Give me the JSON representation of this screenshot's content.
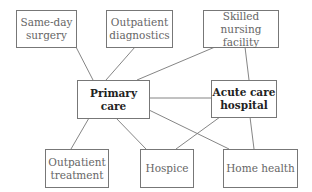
{
  "diagram": {
    "nodes": [
      {
        "id": "same_day_surgery",
        "label": "Same-day surgery",
        "bold": false
      },
      {
        "id": "outpatient_diagnostics",
        "label": "Outpatient diagnostics",
        "bold": false
      },
      {
        "id": "skilled_nursing_facility",
        "label": "Skilled nursing facility",
        "bold": false
      },
      {
        "id": "primary_care",
        "label": "Primary care",
        "bold": true
      },
      {
        "id": "acute_care_hospital",
        "label": "Acute care hospital",
        "bold": true
      },
      {
        "id": "outpatient_treatment",
        "label": "Outpatient treatment",
        "bold": false
      },
      {
        "id": "hospice",
        "label": "Hospice",
        "bold": false
      },
      {
        "id": "home_health",
        "label": "Home health",
        "bold": false
      }
    ],
    "edges": [
      [
        "same_day_surgery",
        "primary_care"
      ],
      [
        "outpatient_diagnostics",
        "primary_care"
      ],
      [
        "skilled_nursing_facility",
        "primary_care"
      ],
      [
        "skilled_nursing_facility",
        "acute_care_hospital"
      ],
      [
        "primary_care",
        "acute_care_hospital"
      ],
      [
        "primary_care",
        "outpatient_treatment"
      ],
      [
        "primary_care",
        "hospice"
      ],
      [
        "primary_care",
        "home_health"
      ],
      [
        "acute_care_hospital",
        "hospice"
      ],
      [
        "acute_care_hospital",
        "home_health"
      ]
    ],
    "labels": {
      "same_day_surgery_l1": "Same-day",
      "same_day_surgery_l2": "surgery",
      "outpatient_diagnostics_l1": "Outpatient",
      "outpatient_diagnostics_l2": "diagnostics",
      "skilled_nursing_facility_l1": "Skilled nursing",
      "skilled_nursing_facility_l2": "facility",
      "primary_care": "Primary care",
      "acute_care_hospital_l1": "Acute care",
      "acute_care_hospital_l2": "hospital",
      "outpatient_treatment_l1": "Outpatient",
      "outpatient_treatment_l2": "treatment",
      "hospice": "Hospice",
      "home_health": "Home health"
    }
  }
}
